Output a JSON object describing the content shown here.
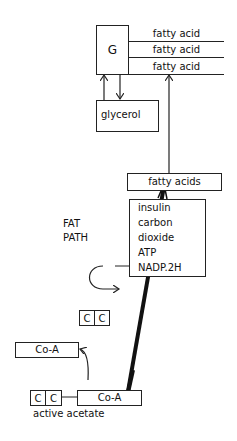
{
  "diagram": {
    "triglyceride": {
      "head": "G",
      "chains": [
        "fatty acid",
        "fatty acid",
        "fatty acid"
      ]
    },
    "glycerol": "glycerol",
    "fatty_acids": "fatty acids",
    "path_label": [
      "FAT",
      "PATH"
    ],
    "cofactors": [
      "insulin",
      "carbon",
      "dioxide",
      "ATP",
      "NADP.2H"
    ],
    "two_carbon_unit": [
      "C",
      "C"
    ],
    "released_coa": "Co-A",
    "active_acetate": {
      "carbons": [
        "C",
        "C"
      ],
      "coa": "Co-A",
      "label": "active acetate"
    }
  }
}
